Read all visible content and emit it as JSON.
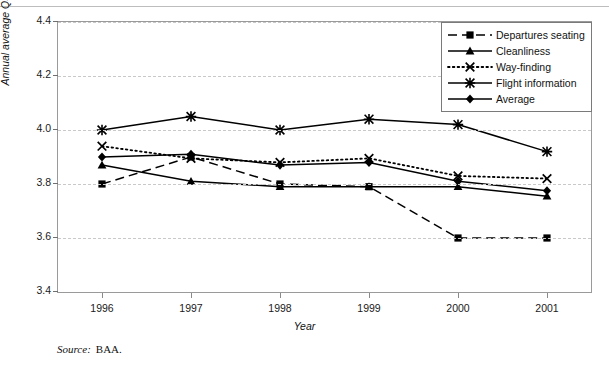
{
  "chart_data": {
    "type": "line",
    "title": "",
    "xlabel": "Year",
    "ylabel": "Annual average QSM score",
    "categories": [
      "1996",
      "1997",
      "1998",
      "1999",
      "2000",
      "2001"
    ],
    "x": [
      1996,
      1997,
      1998,
      1999,
      2000,
      2001
    ],
    "ylim": [
      3.4,
      4.4
    ],
    "yticks": [
      "3.4",
      "3.6",
      "3.8",
      "4.0",
      "4.2",
      "4.4"
    ],
    "grid": "horizontal-dashed",
    "legend_position": "top-right",
    "series": [
      {
        "name": "Departures seating",
        "marker": "square",
        "line": "dashed",
        "values": [
          3.8,
          3.9,
          3.8,
          3.79,
          3.6,
          3.6
        ]
      },
      {
        "name": "Cleanliness",
        "marker": "triangle",
        "line": "solid",
        "values": [
          3.87,
          3.81,
          3.79,
          3.79,
          3.79,
          3.755
        ]
      },
      {
        "name": "Way-finding",
        "marker": "x",
        "line": "dotted",
        "values": [
          3.94,
          3.895,
          3.88,
          3.895,
          3.83,
          3.82
        ]
      },
      {
        "name": "Flight information",
        "marker": "asterisk",
        "line": "solid",
        "values": [
          4.0,
          4.05,
          4.0,
          4.04,
          4.02,
          3.92
        ]
      },
      {
        "name": "Average",
        "marker": "diamond",
        "line": "solid",
        "values": [
          3.9,
          3.91,
          3.87,
          3.88,
          3.81,
          3.775
        ]
      }
    ]
  },
  "caption": {
    "source_label": "Source:",
    "source_value": "BAA."
  },
  "colors": {
    "series_color": "#000000",
    "grid_color": "#c9c9c9",
    "frame_color": "#9a9a9a",
    "text_color": "#111111"
  }
}
